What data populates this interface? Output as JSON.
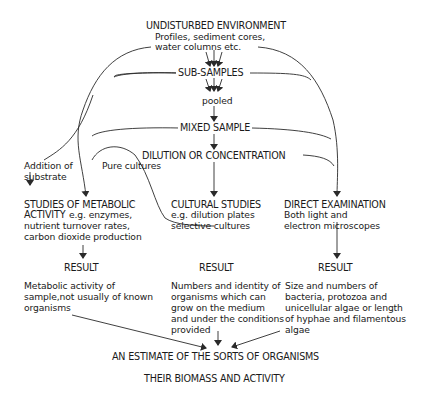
{
  "diagram": {
    "nodes": {
      "undisturbed": {
        "title": "UNDISTURBED ENVIRONMENT",
        "line1": "Profiles, sediment cores,",
        "line2": "water columns etc."
      },
      "subsamples": "SUB-SAMPLES",
      "pooled": "pooled",
      "mixed": "MIXED SAMPLE",
      "dilution": "DILUTION OR CONCENTRATION",
      "addition": {
        "line1": "Addition of",
        "line2": "substrate"
      },
      "pure": "Pure cultures",
      "metabolic": {
        "title1": "STUDIES OF METABOLIC",
        "title2": "ACTIVITY",
        "detail1": "e.g. enzymes,",
        "detail2": "nutrient turnover rates,",
        "detail3": "carbon dioxide production"
      },
      "cultural": {
        "title": "CULTURAL STUDIES",
        "detail1": "e.g. dilution plates",
        "detail2": "selective cultures"
      },
      "direct": {
        "title": "DIRECT EXAMINATION",
        "detail1": "Both light and",
        "detail2": "electron microscopes"
      },
      "result_label": "RESULT",
      "result_metabolic": {
        "line1": "Metabolic activity of",
        "line2": "sample,not usually of known",
        "line3": "organisms"
      },
      "result_cultural": {
        "line1": "Numbers and identity of",
        "line2": "organisms which can",
        "line3": "grow on the medium",
        "line4": "and under the conditions",
        "line5": "provided"
      },
      "result_direct": {
        "line1": "Size and numbers of",
        "line2": "bacteria, protozoa and",
        "line3": "unicellular algae or length",
        "line4": "of hyphae and filamentous",
        "line5": "algae"
      },
      "estimate": "AN ESTIMATE OF THE SORTS OF ORGANISMS",
      "biomass": "THEIR BIOMASS AND ACTIVITY"
    },
    "colors": {
      "line": "#2a2a2a",
      "text": "#1a1a1a",
      "background": "#ffffff"
    }
  }
}
